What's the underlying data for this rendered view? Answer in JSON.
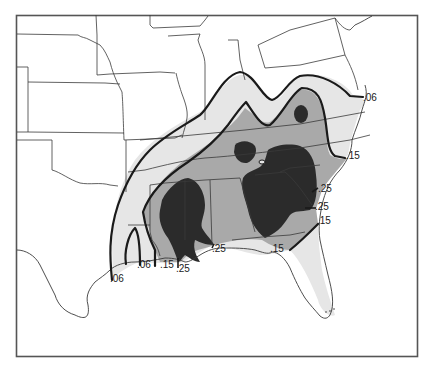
{
  "map": {
    "region": "Southeastern United States",
    "colors": {
      "background": "#ffffff",
      "frame": "#555555",
      "zone_006": "#e6e6e6",
      "zone_015": "#a9a9a9",
      "zone_025": "#2b2b2b",
      "contour": "#1a1a1a",
      "state_border": "#3a3a3a"
    },
    "legend_note": "Contour values shown as isoline labels",
    "contour_values": [
      ".06",
      ".15",
      ".25"
    ],
    "labels": [
      {
        "id": "label-atlantic-006",
        "text": ".06",
        "x": 363,
        "y": 100
      },
      {
        "id": "label-atlantic-015",
        "text": ".15",
        "x": 345,
        "y": 157
      },
      {
        "id": "label-atlantic-025-a",
        "text": ".25",
        "x": 319,
        "y": 191
      },
      {
        "id": "label-atlantic-025-b",
        "text": ".25",
        "x": 316,
        "y": 209
      },
      {
        "id": "label-atlantic-015-b",
        "text": ".15",
        "x": 318,
        "y": 224
      },
      {
        "id": "label-gulf-015-fl",
        "text": ".15",
        "x": 271,
        "y": 251
      },
      {
        "id": "label-gulf-025-al",
        "text": ".25",
        "x": 210,
        "y": 249
      },
      {
        "id": "label-gulf-025-la",
        "text": ".25",
        "x": 177,
        "y": 271
      },
      {
        "id": "label-gulf-015-la",
        "text": ".15",
        "x": 160,
        "y": 268
      },
      {
        "id": "label-gulf-006-la",
        "text": ".06",
        "x": 137,
        "y": 268
      },
      {
        "id": "label-gulf-006-tx",
        "text": ".06",
        "x": 110,
        "y": 284
      }
    ]
  }
}
